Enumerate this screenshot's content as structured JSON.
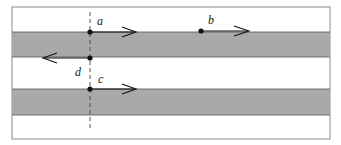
{
  "diagram": {
    "frame": {
      "x": 12,
      "y": 7,
      "width": 318,
      "height": 132,
      "border_color": "#8c8c8c"
    },
    "bands": [
      {
        "y": 32,
        "height": 25,
        "color": "#a9a9a9"
      },
      {
        "y": 89,
        "height": 26,
        "color": "#a9a9a9"
      }
    ],
    "dashed_line": {
      "x": 90,
      "y1": 12,
      "y2": 130
    },
    "points": [
      {
        "label": "a",
        "x": 90,
        "y": 32,
        "arrow_to": 135,
        "direction": "right"
      },
      {
        "label": "b",
        "x": 201,
        "y": 31,
        "arrow_to": 248,
        "direction": "right"
      },
      {
        "label": "d",
        "x": 90,
        "y": 58,
        "arrow_to": 42,
        "direction": "left"
      },
      {
        "label": "c",
        "x": 90,
        "y": 89,
        "arrow_to": 135,
        "direction": "right"
      }
    ],
    "labels": {
      "a": "a",
      "b": "b",
      "c": "c",
      "d": "d"
    }
  }
}
